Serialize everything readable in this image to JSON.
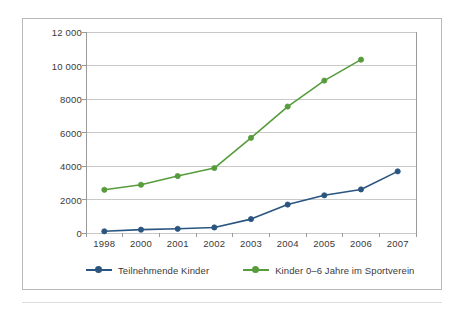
{
  "chart_data": {
    "type": "line",
    "title": "",
    "subtitle": "",
    "xlabel": "",
    "ylabel": "",
    "categories": [
      "1998",
      "2000",
      "2001",
      "2002",
      "2003",
      "2004",
      "2005",
      "2006",
      "2007"
    ],
    "ylim": [
      0,
      12000
    ],
    "y_ticks": [
      0,
      2000,
      4000,
      6000,
      8000,
      10000,
      12000
    ],
    "y_tick_labels": [
      "0",
      "2000",
      "4000",
      "6000",
      "8000",
      "10 000",
      "12 000"
    ],
    "grid": "horizontal",
    "legend_position": "bottom",
    "series": [
      {
        "name": "Teilnehmende Kinder",
        "color": "#2A5580",
        "marker": "circle",
        "values": [
          100,
          200,
          250,
          330,
          830,
          1700,
          2250,
          2600,
          3680
        ]
      },
      {
        "name": "Kinder 0–6 Jahre im Sportverein",
        "color": "#579C3C",
        "marker": "circle",
        "values": [
          2580,
          2880,
          3400,
          3880,
          5680,
          7550,
          9100,
          10350,
          null
        ]
      }
    ]
  },
  "legend": {
    "entries": [
      {
        "label": "Teilnehmende Kinder",
        "color": "#2A5580"
      },
      {
        "label": "Kinder 0–6 Jahre im Sportverein",
        "color": "#579C3C"
      }
    ]
  },
  "style": {
    "axis_color": "#9a9a9a",
    "grid_color": "#c9c9c9",
    "frame_color": "#b8b8b8",
    "text_color": "#3a3a3a",
    "background": "#ffffff"
  }
}
